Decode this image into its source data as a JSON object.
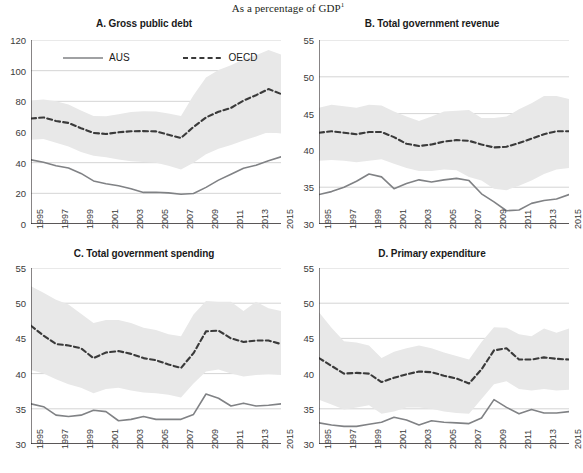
{
  "figure": {
    "supertitle": "As a percentage of GDP",
    "supertitle_footnote": "1",
    "legend": [
      {
        "label": "AUS",
        "style": "solid",
        "color": "#808285"
      },
      {
        "label": "OECD",
        "style": "dashed",
        "color": "#3a3a3a"
      }
    ],
    "band_color": "#e8e8e8",
    "grid_color": "#c9c9c9",
    "axis_color": "#231f20"
  },
  "chart_data": [
    {
      "type": "line",
      "panel": "A",
      "title": "A. Gross public debt",
      "xlabel": "",
      "ylabel": "",
      "ylim": [
        0,
        120
      ],
      "yticks": [
        0,
        20,
        40,
        60,
        80,
        100,
        120
      ],
      "xlim": [
        1995,
        2015
      ],
      "x": [
        1995,
        1996,
        1997,
        1998,
        1999,
        2000,
        2001,
        2002,
        2003,
        2004,
        2005,
        2006,
        2007,
        2008,
        2009,
        2010,
        2011,
        2012,
        2013,
        2014,
        2015
      ],
      "xticks": [
        1995,
        1997,
        1999,
        2001,
        2003,
        2005,
        2007,
        2009,
        2011,
        2013,
        2015
      ],
      "grid": true,
      "legend_position": "top-inside",
      "series": [
        {
          "name": "AUS",
          "style": "solid",
          "values": [
            41.8,
            40.3,
            38.0,
            36.5,
            33.0,
            28.1,
            26.3,
            25.0,
            23.0,
            20.6,
            20.7,
            20.3,
            19.4,
            19.9,
            23.9,
            28.6,
            32.5,
            36.3,
            38.3,
            41.3,
            43.8
          ]
        },
        {
          "name": "OECD",
          "style": "dashed",
          "values": [
            68.8,
            69.5,
            67.2,
            65.9,
            62.5,
            59.4,
            58.7,
            59.8,
            60.5,
            60.6,
            60.4,
            58.2,
            56.1,
            63.3,
            69.5,
            73.2,
            75.7,
            80.5,
            84.0,
            88.0,
            84.8
          ]
        }
      ],
      "band": {
        "name": "OECD range",
        "upper": [
          80.6,
          81.2,
          80.0,
          78.0,
          74.0,
          70.5,
          70.3,
          71.5,
          73.0,
          73.5,
          73.3,
          72.0,
          70.5,
          84.0,
          95.5,
          100.5,
          103.5,
          107.5,
          110.0,
          113.5,
          110.5
        ],
        "lower": [
          55.0,
          55.5,
          53.0,
          50.5,
          47.0,
          44.5,
          43.5,
          42.0,
          41.0,
          40.5,
          40.0,
          38.0,
          35.5,
          40.0,
          45.5,
          49.0,
          51.5,
          54.5,
          57.0,
          60.0,
          59.0
        ]
      }
    },
    {
      "type": "line",
      "panel": "B",
      "title": "B. Total government revenue",
      "xlabel": "",
      "ylabel": "",
      "ylim": [
        30,
        55
      ],
      "yticks": [
        30,
        35,
        40,
        45,
        50,
        55
      ],
      "xlim": [
        1995,
        2015
      ],
      "x": [
        1995,
        1996,
        1997,
        1998,
        1999,
        2000,
        2001,
        2002,
        2003,
        2004,
        2005,
        2006,
        2007,
        2008,
        2009,
        2010,
        2011,
        2012,
        2013,
        2014,
        2015
      ],
      "xticks": [
        1995,
        1997,
        1999,
        2001,
        2003,
        2005,
        2007,
        2009,
        2011,
        2013,
        2015
      ],
      "grid": true,
      "series": [
        {
          "name": "AUS",
          "style": "solid",
          "values": [
            34.0,
            34.4,
            35.0,
            35.8,
            36.8,
            36.4,
            34.8,
            35.5,
            36.0,
            35.7,
            36.0,
            36.2,
            35.9,
            34.1,
            33.0,
            31.8,
            31.9,
            32.8,
            33.2,
            33.4,
            34.0
          ]
        },
        {
          "name": "OECD",
          "style": "dashed",
          "values": [
            42.4,
            42.6,
            42.4,
            42.2,
            42.5,
            42.5,
            41.8,
            40.9,
            40.6,
            40.8,
            41.2,
            41.4,
            41.3,
            40.8,
            40.4,
            40.5,
            41.0,
            41.6,
            42.2,
            42.6,
            42.6
          ]
        }
      ],
      "band": {
        "name": "OECD range",
        "upper": [
          45.8,
          46.2,
          46.0,
          45.8,
          46.2,
          46.1,
          45.3,
          44.6,
          44.0,
          44.6,
          45.3,
          45.4,
          45.5,
          44.4,
          44.4,
          44.6,
          45.6,
          46.4,
          47.4,
          47.4,
          47.0
        ],
        "lower": [
          38.6,
          38.7,
          38.6,
          38.4,
          38.6,
          38.8,
          38.2,
          37.6,
          37.2,
          37.2,
          37.4,
          37.3,
          36.4,
          35.9,
          34.8,
          34.6,
          35.2,
          35.9,
          36.8,
          37.4,
          37.6
        ]
      }
    },
    {
      "type": "line",
      "panel": "C",
      "title": "C. Total government spending",
      "xlabel": "",
      "ylabel": "",
      "ylim": [
        30,
        55
      ],
      "yticks": [
        30,
        35,
        40,
        45,
        50,
        55
      ],
      "xlim": [
        1995,
        2015
      ],
      "x": [
        1995,
        1996,
        1997,
        1998,
        1999,
        2000,
        2001,
        2002,
        2003,
        2004,
        2005,
        2006,
        2007,
        2008,
        2009,
        2010,
        2011,
        2012,
        2013,
        2014,
        2015
      ],
      "xticks": [
        1995,
        1997,
        1999,
        2001,
        2003,
        2005,
        2007,
        2009,
        2011,
        2013,
        2015
      ],
      "grid": true,
      "series": [
        {
          "name": "AUS",
          "style": "solid",
          "values": [
            35.7,
            35.3,
            34.1,
            33.9,
            34.1,
            34.8,
            34.6,
            33.3,
            33.5,
            33.9,
            33.5,
            33.5,
            33.5,
            34.2,
            37.1,
            36.5,
            35.4,
            35.8,
            35.4,
            35.5,
            35.7
          ]
        },
        {
          "name": "OECD",
          "style": "dashed",
          "values": [
            46.8,
            45.4,
            44.2,
            44.0,
            43.6,
            42.2,
            43.0,
            43.2,
            42.8,
            42.2,
            41.9,
            41.3,
            40.8,
            42.9,
            46.0,
            46.1,
            45.0,
            44.5,
            44.7,
            44.7,
            44.2
          ]
        }
      ],
      "band": {
        "name": "OECD range",
        "upper": [
          52.4,
          51.5,
          50.5,
          49.8,
          48.5,
          47.2,
          47.6,
          47.6,
          47.2,
          46.5,
          46.2,
          45.6,
          45.3,
          48.4,
          50.3,
          50.2,
          50.2,
          48.9,
          50.2,
          49.3,
          48.9
        ],
        "lower": [
          40.5,
          40.0,
          39.2,
          38.5,
          38.0,
          37.2,
          37.8,
          38.0,
          37.6,
          37.3,
          37.2,
          37.0,
          36.6,
          38.6,
          40.3,
          40.6,
          40.0,
          39.6,
          39.8,
          39.9,
          39.8
        ]
      }
    },
    {
      "type": "line",
      "panel": "D",
      "title": "D. Primary expenditure",
      "xlabel": "",
      "ylabel": "",
      "ylim": [
        30,
        55
      ],
      "yticks": [
        30,
        35,
        40,
        45,
        50,
        55
      ],
      "xlim": [
        1995,
        2015
      ],
      "x": [
        1995,
        1996,
        1997,
        1998,
        1999,
        2000,
        2001,
        2002,
        2003,
        2004,
        2005,
        2006,
        2007,
        2008,
        2009,
        2010,
        2011,
        2012,
        2013,
        2014,
        2015
      ],
      "xticks": [
        1995,
        1997,
        1999,
        2001,
        2003,
        2005,
        2007,
        2009,
        2011,
        2013,
        2015
      ],
      "grid": true,
      "series": [
        {
          "name": "AUS",
          "style": "solid",
          "values": [
            33.0,
            32.7,
            32.5,
            32.5,
            32.8,
            33.1,
            33.8,
            33.4,
            32.7,
            33.3,
            33.1,
            33.0,
            32.9,
            33.7,
            36.3,
            35.2,
            34.3,
            34.9,
            34.4,
            34.4,
            34.6
          ]
        },
        {
          "name": "OECD",
          "style": "dashed",
          "values": [
            42.2,
            41.1,
            40.0,
            40.1,
            40.0,
            38.8,
            39.4,
            39.9,
            40.3,
            40.2,
            39.7,
            39.3,
            38.6,
            40.6,
            43.3,
            43.6,
            42.0,
            42.0,
            42.3,
            42.1,
            42.0
          ]
        },
        {
          "name": "AUS-2",
          "style": "solid",
          "values": [
            33.0,
            32.7,
            32.5,
            32.5,
            32.8,
            33.1,
            33.8,
            33.4,
            32.7,
            33.3,
            33.1,
            33.0,
            32.9,
            33.7,
            36.3,
            35.2,
            34.3,
            34.9,
            34.4,
            34.4,
            34.6
          ]
        }
      ],
      "band": {
        "name": "OECD range",
        "upper": [
          48.7,
          46.5,
          44.6,
          44.4,
          44.0,
          42.2,
          43.1,
          43.6,
          44.0,
          43.6,
          43.0,
          42.5,
          42.0,
          44.5,
          46.6,
          46.5,
          45.6,
          45.3,
          46.4,
          45.8,
          46.4
        ],
        "lower": [
          36.3,
          35.6,
          34.9,
          35.2,
          35.5,
          34.3,
          34.6,
          35.2,
          35.2,
          35.0,
          34.6,
          34.4,
          34.3,
          36.4,
          38.5,
          38.9,
          37.8,
          37.6,
          37.8,
          37.6,
          37.7
        ]
      }
    }
  ]
}
